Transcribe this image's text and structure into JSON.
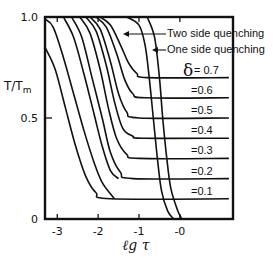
{
  "chart_data": {
    "type": "line",
    "title": "",
    "xlabel": "ℓg τ",
    "ylabel": "T/Tm",
    "xlim": [
      -3.3,
      1.3
    ],
    "ylim": [
      0,
      1.0
    ],
    "grid": false,
    "x_ticks": [
      -3,
      -2,
      -1,
      0
    ],
    "x_tick_labels": [
      "-3",
      "-2",
      "-1",
      "-0"
    ],
    "y_ticks": [
      0,
      0.5,
      1.0
    ],
    "y_tick_labels": [
      "0",
      "0.5",
      "1.0"
    ],
    "annotations": [
      {
        "text": "Two side quenching",
        "arrow_to": "two-side envelope curve"
      },
      {
        "text": "One side quenching",
        "arrow_to": "one-side envelope curve"
      }
    ],
    "delta_symbol": "δ",
    "series": [
      {
        "name": "δ = 0.7",
        "label": "δ = 0.7",
        "plateau": 0.7,
        "points": [
          [
            -1.95,
            1.0
          ],
          [
            -1.7,
            0.96
          ],
          [
            -1.45,
            0.86
          ],
          [
            -1.25,
            0.77
          ],
          [
            -1.05,
            0.72
          ],
          [
            -0.8,
            0.7
          ],
          [
            1.2,
            0.7
          ]
        ]
      },
      {
        "name": "δ = 0.6",
        "label": "=0.6",
        "plateau": 0.6,
        "points": [
          [
            -2.05,
            1.0
          ],
          [
            -1.8,
            0.95
          ],
          [
            -1.55,
            0.82
          ],
          [
            -1.35,
            0.69
          ],
          [
            -1.15,
            0.62
          ],
          [
            -0.85,
            0.6
          ],
          [
            1.2,
            0.6
          ]
        ]
      },
      {
        "name": "δ = 0.5",
        "label": "=0.5",
        "plateau": 0.5,
        "points": [
          [
            -2.2,
            1.0
          ],
          [
            -1.95,
            0.94
          ],
          [
            -1.7,
            0.78
          ],
          [
            -1.5,
            0.62
          ],
          [
            -1.3,
            0.53
          ],
          [
            -1.0,
            0.5
          ],
          [
            1.2,
            0.5
          ]
        ]
      },
      {
        "name": "δ = 0.4",
        "label": "=0.4",
        "plateau": 0.4,
        "points": [
          [
            -2.3,
            1.0
          ],
          [
            -2.05,
            0.93
          ],
          [
            -1.8,
            0.76
          ],
          [
            -1.6,
            0.58
          ],
          [
            -1.4,
            0.45
          ],
          [
            -1.15,
            0.41
          ],
          [
            -0.9,
            0.4
          ],
          [
            1.2,
            0.4
          ]
        ]
      },
      {
        "name": "δ = 0.3",
        "label": "=0.3",
        "plateau": 0.3,
        "points": [
          [
            -2.45,
            1.0
          ],
          [
            -2.2,
            0.92
          ],
          [
            -1.95,
            0.74
          ],
          [
            -1.75,
            0.55
          ],
          [
            -1.55,
            0.4
          ],
          [
            -1.3,
            0.32
          ],
          [
            -1.0,
            0.3
          ],
          [
            1.2,
            0.3
          ]
        ]
      },
      {
        "name": "δ = 0.2",
        "label": "=0.2",
        "plateau": 0.2,
        "points": [
          [
            -2.65,
            1.0
          ],
          [
            -2.4,
            0.9
          ],
          [
            -2.15,
            0.7
          ],
          [
            -1.9,
            0.5
          ],
          [
            -1.7,
            0.33
          ],
          [
            -1.45,
            0.23
          ],
          [
            -1.15,
            0.2
          ],
          [
            1.2,
            0.2
          ]
        ]
      },
      {
        "name": "δ = 0.1",
        "label": "=0.1",
        "plateau": 0.1,
        "points": [
          [
            -3.3,
            0.85
          ],
          [
            -3.05,
            0.74
          ],
          [
            -2.8,
            0.55
          ],
          [
            -2.55,
            0.36
          ],
          [
            -2.3,
            0.21
          ],
          [
            -2.05,
            0.13
          ],
          [
            -1.7,
            0.1
          ],
          [
            1.2,
            0.1
          ]
        ]
      },
      {
        "name": "extra curve 1",
        "label": "",
        "points": [
          [
            -3.3,
            0.99
          ],
          [
            -3.1,
            0.95
          ],
          [
            -2.85,
            0.8
          ],
          [
            -2.6,
            0.62
          ],
          [
            -2.35,
            0.44
          ],
          [
            -2.1,
            0.28
          ],
          [
            -1.9,
            0.18
          ],
          [
            -1.6,
            0.1
          ]
        ]
      },
      {
        "name": "extra curve 2",
        "label": "",
        "points": [
          [
            -2.85,
            1.0
          ],
          [
            -2.6,
            0.9
          ],
          [
            -2.35,
            0.72
          ],
          [
            -2.1,
            0.52
          ],
          [
            -1.9,
            0.36
          ],
          [
            -1.7,
            0.24
          ],
          [
            -1.5,
            0.2
          ]
        ]
      },
      {
        "name": "Two side quenching",
        "label": "Two side quenching",
        "points": [
          [
            -1.3,
            1.0
          ],
          [
            -1.0,
            0.96
          ],
          [
            -0.85,
            0.86
          ],
          [
            -0.75,
            0.7
          ],
          [
            -0.65,
            0.5
          ],
          [
            -0.55,
            0.3
          ],
          [
            -0.45,
            0.14
          ],
          [
            -0.3,
            0.04
          ],
          [
            -0.15,
            0.0
          ]
        ]
      },
      {
        "name": "One side quenching",
        "label": "One side quenching",
        "points": [
          [
            -0.8,
            1.0
          ],
          [
            -0.62,
            0.9
          ],
          [
            -0.5,
            0.7
          ],
          [
            -0.42,
            0.5
          ],
          [
            -0.32,
            0.3
          ],
          [
            -0.22,
            0.15
          ],
          [
            -0.05,
            0.04
          ],
          [
            0.05,
            0.0
          ]
        ]
      }
    ]
  }
}
